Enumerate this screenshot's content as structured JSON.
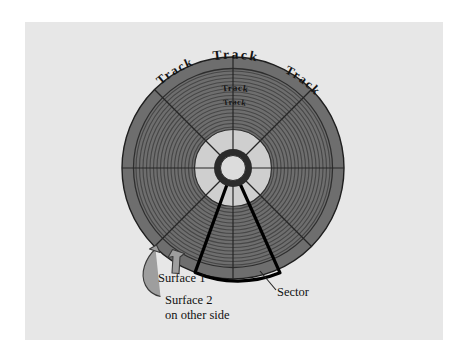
{
  "figure": {
    "background_color": "#ffffff",
    "panel_color": "#e7e7e7",
    "disk_color": "#6e6e6e",
    "track_ring_color": "#4a4a4a",
    "inner_disk_color": "#cfcfcf",
    "hub_ring_color": "#2b2b2b",
    "hub_hole_color": "#d9d9d9",
    "divider_color": "#2a2a2a",
    "highlight_color": "#000000",
    "label_color": "#111111",
    "arrow_fill_color": "#9a9a9a",
    "arrow_stroke_color": "#3a3a3a"
  },
  "labels": {
    "track_outer_left": "Track",
    "track_outer_top": "Track",
    "track_outer_right": "Track",
    "track_inner_upper": "Track",
    "track_inner_lower": "Track",
    "surface_1": "Surface 1",
    "surface_2_line1": "Surface 2",
    "surface_2_line2": "on other side",
    "sector": "Sector"
  },
  "geometry": {
    "center_x": 233,
    "center_y": 168,
    "outer_radius": 111,
    "inner_disk_radius": 38,
    "hub_outer_radius": 19,
    "hub_hole_radius": 12,
    "track_count": 19,
    "sector_count": 8,
    "highlight_sector_start_deg": 250,
    "highlight_sector_end_deg": 295
  }
}
